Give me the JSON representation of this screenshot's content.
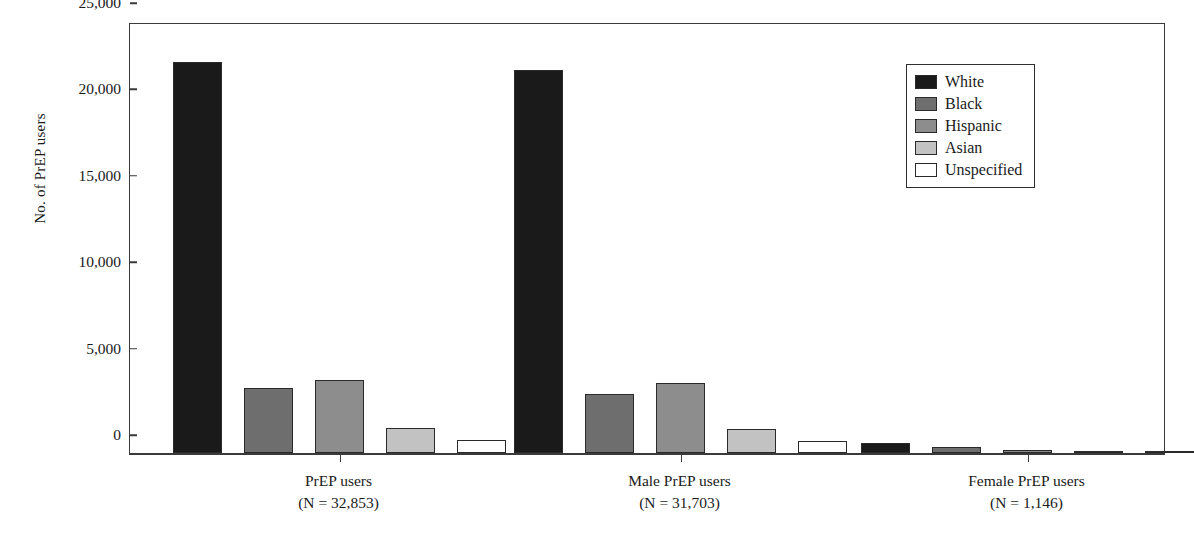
{
  "chart_data": {
    "type": "bar",
    "title": "",
    "subtitle": "",
    "xlabel": "",
    "ylabel": "No. of PrEP users",
    "ylim": [
      0,
      25000
    ],
    "ytick_values": [
      0,
      5000,
      10000,
      15000,
      20000,
      25000
    ],
    "ytick_labels": [
      "0",
      "5,000",
      "10,000",
      "15,000",
      "20,000",
      "25,000"
    ],
    "grid": false,
    "legend_position": "top-right",
    "categories": [
      "PrEP users",
      "Male PrEP users",
      "Female PrEP users"
    ],
    "category_captions": [
      {
        "line1": "PrEP users",
        "line2": "(N = 32,853)"
      },
      {
        "line1": "Male PrEP users",
        "line2": "(N = 31,703)"
      },
      {
        "line1": "Female PrEP users",
        "line2": "(N = 1,146)"
      }
    ],
    "series": [
      {
        "name": "White",
        "color": "#1a1a1a",
        "values": [
          22600,
          22150,
          580
        ]
      },
      {
        "name": "Black",
        "color": "#6e6e6e",
        "values": [
          3750,
          3400,
          330
        ]
      },
      {
        "name": "Hispanic",
        "color": "#8d8d8d",
        "values": [
          4250,
          4050,
          180
        ]
      },
      {
        "name": "Asian",
        "color": "#c2c2c2",
        "values": [
          1450,
          1400,
          60
        ]
      },
      {
        "name": "Unspecified",
        "color": "#ffffff",
        "values": [
          750,
          700,
          40
        ]
      }
    ]
  },
  "legend": {
    "items": [
      {
        "label": "White",
        "color": "#1a1a1a"
      },
      {
        "label": "Black",
        "color": "#6e6e6e"
      },
      {
        "label": "Hispanic",
        "color": "#8d8d8d"
      },
      {
        "label": "Asian",
        "color": "#c2c2c2"
      },
      {
        "label": "Unspecified",
        "color": "#ffffff"
      }
    ]
  }
}
